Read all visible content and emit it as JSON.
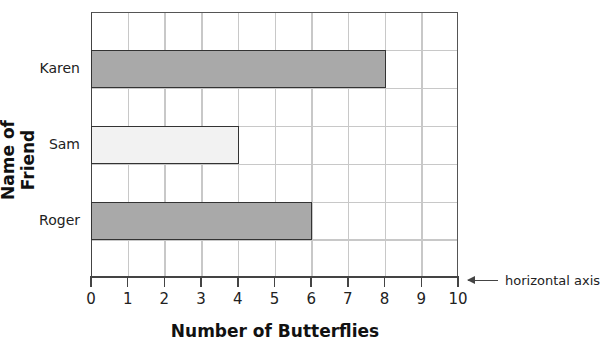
{
  "chart_data": {
    "type": "bar",
    "orientation": "horizontal",
    "title": "",
    "categories": [
      "Karen",
      "Sam",
      "Roger"
    ],
    "values": [
      8,
      4,
      6
    ],
    "bar_colors": [
      "#a9a9a9",
      "#f2f2f2",
      "#a9a9a9"
    ],
    "xlabel": "Number of Butterflies",
    "ylabel": "Name of Friend",
    "xlim": [
      0,
      10
    ],
    "xticks": [
      "0",
      "1",
      "2",
      "3",
      "4",
      "5",
      "6",
      "7",
      "8",
      "9",
      "10"
    ],
    "grid": true,
    "annotations": [
      {
        "text": "horizontal axis",
        "target": "x-axis",
        "arrow": true
      }
    ]
  },
  "labels": {
    "ylabel": "Name of Friend",
    "xlabel": "Number of Butterflies",
    "annotation": "horizontal axis",
    "categories": [
      "Karen",
      "Sam",
      "Roger"
    ],
    "ticks": [
      "0",
      "1",
      "2",
      "3",
      "4",
      "5",
      "6",
      "7",
      "8",
      "9",
      "10"
    ]
  }
}
